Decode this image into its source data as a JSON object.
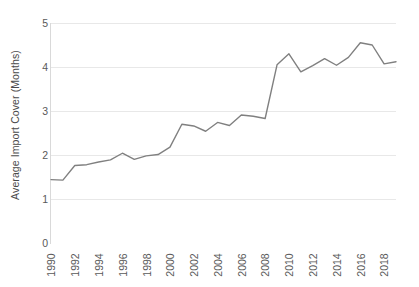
{
  "chart_data": {
    "type": "line",
    "title": "",
    "xlabel": "",
    "ylabel": "Average Import Cover (Months)",
    "ylim": [
      0,
      5
    ],
    "xlim": [
      1990,
      2019
    ],
    "grid": true,
    "legend": "none",
    "line_color": "#808080",
    "gridline_color": "#e8e8e8",
    "y_ticks": [
      0,
      1,
      2,
      3,
      4,
      5
    ],
    "y_tick_labels": [
      "0",
      "1",
      "2",
      "3",
      "4",
      "5"
    ],
    "x_ticks": [
      1990,
      1992,
      1994,
      1996,
      1998,
      2000,
      2002,
      2004,
      2006,
      2008,
      2010,
      2012,
      2014,
      2016,
      2018
    ],
    "x_tick_labels": [
      "1990",
      "1992",
      "1994",
      "1996",
      "1998",
      "2000",
      "2002",
      "2004",
      "2006",
      "2008",
      "2010",
      "2012",
      "2014",
      "2016",
      "2018"
    ],
    "x": [
      1990,
      1991,
      1992,
      1993,
      1994,
      1995,
      1996,
      1997,
      1998,
      1999,
      2000,
      2001,
      2002,
      2003,
      2004,
      2005,
      2006,
      2007,
      2008,
      2009,
      2010,
      2011,
      2012,
      2013,
      2014,
      2015,
      2016,
      2017,
      2018,
      2019
    ],
    "series": [
      {
        "name": "Average Import Cover",
        "values": [
          1.44,
          1.43,
          1.76,
          1.78,
          1.84,
          1.89,
          2.04,
          1.9,
          1.98,
          2.01,
          2.18,
          2.7,
          2.66,
          2.54,
          2.74,
          2.67,
          2.91,
          2.88,
          2.83,
          4.05,
          4.3,
          3.89,
          4.03,
          4.19,
          4.04,
          4.22,
          4.55,
          4.5,
          4.07,
          4.12
        ]
      }
    ]
  }
}
